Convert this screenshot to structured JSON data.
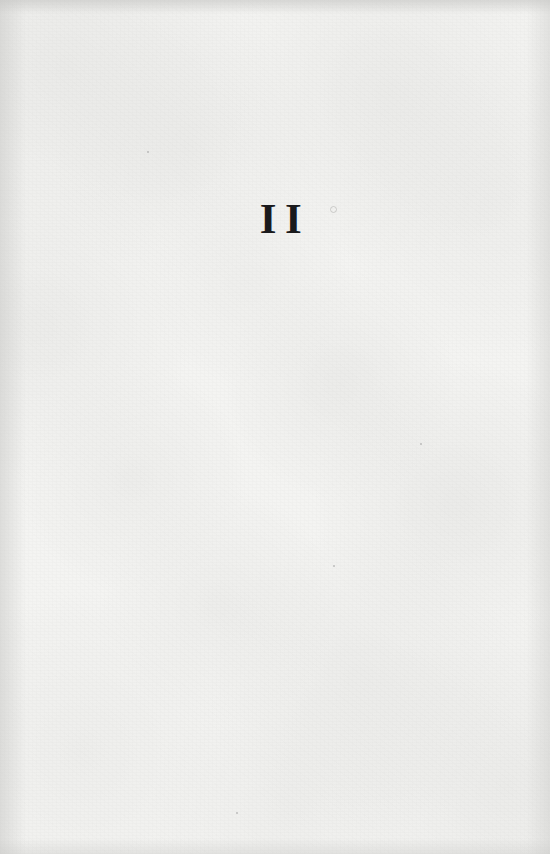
{
  "page": {
    "kind": "part-title-page",
    "part_number": "II",
    "body_text": "",
    "running_head": "",
    "folio": "",
    "colors": {
      "paper": "#f4f4f2",
      "ink": "#1a1a1c",
      "edge_shadow": "#c6c6c4"
    }
  },
  "artifacts": {
    "specks": [
      {
        "name": "dust-speck-right-of-numeral",
        "x": 332,
        "y": 208,
        "size": 3,
        "ring": true
      },
      {
        "name": "dust-speck-upper-left",
        "x": 147,
        "y": 151,
        "size": 2,
        "ring": false
      },
      {
        "name": "dust-speck-mid-right",
        "x": 420,
        "y": 443,
        "size": 2,
        "ring": false
      },
      {
        "name": "dust-speck-lower-centre",
        "x": 333,
        "y": 565,
        "size": 2,
        "ring": false
      },
      {
        "name": "dust-speck-bottom-centre",
        "x": 236,
        "y": 812,
        "size": 2,
        "ring": false
      }
    ]
  }
}
